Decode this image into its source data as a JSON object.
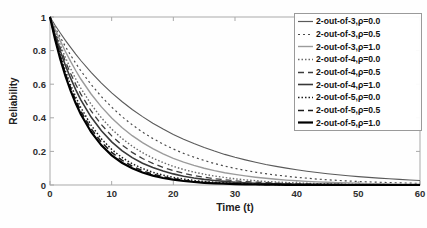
{
  "figure": {
    "kind": "scanned-journal-figure"
  },
  "chart_data": {
    "type": "line",
    "title": "",
    "xlabel": "Time (t)",
    "ylabel": "Reliability",
    "xlim": [
      0,
      60
    ],
    "ylim": [
      0,
      1
    ],
    "grid": false,
    "box": true,
    "legend_position": "top-right",
    "x_ticks": [
      0,
      10,
      20,
      30,
      40,
      50,
      60
    ],
    "x_tick_labels": [
      "0",
      "10",
      "20",
      "30",
      "40",
      "50",
      "60"
    ],
    "y_ticks": [
      0,
      0.2,
      0.4,
      0.6,
      0.8,
      1
    ],
    "y_tick_labels": [
      "0",
      "0.2",
      "0.4",
      "0.6",
      "0.8",
      "1"
    ],
    "x": [
      0,
      5,
      10,
      15,
      20,
      25,
      30,
      35,
      40,
      45,
      50,
      55,
      60
    ],
    "series": [
      {
        "name": "2-out-of-3,ρ=0.0",
        "color": "#5a5a5a",
        "width": 1.1,
        "dash": "",
        "values": [
          1,
          0.741,
          0.549,
          0.407,
          0.301,
          0.223,
          0.165,
          0.122,
          0.091,
          0.067,
          0.05,
          0.037,
          0.027
        ]
      },
      {
        "name": "2-out-of-3,ρ=0.5",
        "color": "#4a4a4a",
        "width": 1.2,
        "dash": "2 3",
        "values": [
          1,
          0.68,
          0.463,
          0.315,
          0.214,
          0.146,
          0.099,
          0.067,
          0.046,
          0.031,
          0.021,
          0.0145,
          0.0098
        ]
      },
      {
        "name": "2-out-of-3,ρ=1.0",
        "color": "#9b9b9b",
        "width": 1.4,
        "dash": "",
        "values": [
          1,
          0.631,
          0.399,
          0.252,
          0.159,
          0.1,
          0.063,
          0.04,
          0.025,
          0.016,
          0.01,
          0.0063,
          0.004
        ]
      },
      {
        "name": "2-out-of-4,ρ=0.0",
        "color": "#6a6a6a",
        "width": 1.4,
        "dash": "1.5 2",
        "values": [
          1,
          0.577,
          0.333,
          0.192,
          0.111,
          0.064,
          0.037,
          0.021,
          0.0123,
          0.0071,
          0.0041,
          0.0024,
          0.0014
        ]
      },
      {
        "name": "2-out-of-4,ρ=0.5",
        "color": "#3c3c3c",
        "width": 1.3,
        "dash": "6 4",
        "values": [
          1,
          0.541,
          0.292,
          0.158,
          0.0855,
          0.0463,
          0.025,
          0.0135,
          0.0073,
          0.004,
          0.0021,
          0.0012,
          0.0006
        ]
      },
      {
        "name": "2-out-of-4,ρ=1.0",
        "color": "#383838",
        "width": 1.6,
        "dash": "",
        "values": [
          1,
          0.507,
          0.257,
          0.13,
          0.066,
          0.0334,
          0.0169,
          0.0086,
          0.0043,
          0.0022,
          0.0011,
          0.0006,
          0.0003
        ]
      },
      {
        "name": "2-out-of-5,ρ=0.0",
        "color": "#1c1c1c",
        "width": 1.5,
        "dash": "1.5 2",
        "values": [
          1,
          0.461,
          0.212,
          0.098,
          0.0451,
          0.0208,
          0.0096,
          0.0044,
          0.002,
          0.0009,
          0.0004,
          0.0002,
          0.0001
        ]
      },
      {
        "name": "2-out-of-5,ρ=0.5",
        "color": "#1c1c1c",
        "width": 1.5,
        "dash": "6 4",
        "values": [
          1,
          0.44,
          0.194,
          0.0853,
          0.0376,
          0.0165,
          0.0073,
          0.0032,
          0.0014,
          0.0006,
          0.0003,
          0.0001,
          6e-05
        ]
      },
      {
        "name": "2-out-of-5,ρ=1.0",
        "color": "#000000",
        "width": 2.2,
        "dash": "",
        "values": [
          1,
          0.421,
          0.177,
          0.0746,
          0.0314,
          0.0132,
          0.0056,
          0.0023,
          0.001,
          0.0004,
          0.0002,
          8e-05,
          3e-05
        ]
      }
    ]
  }
}
